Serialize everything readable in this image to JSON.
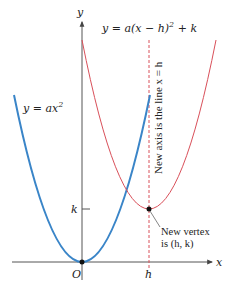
{
  "diagram": {
    "type": "parabola-translation",
    "axes": {
      "x_label": "x",
      "y_label": "y",
      "origin_label": "O",
      "h_tick_label": "h",
      "k_tick_label": "k"
    },
    "curves": [
      {
        "name": "original-parabola",
        "equation_lhs": "y = ax",
        "equation_exp": "2",
        "color": "#3a85c8",
        "vertex": "(0, 0)"
      },
      {
        "name": "translated-parabola",
        "equation": "y = a(x − h)",
        "equation_exp": "2",
        "equation_tail": " + k",
        "color": "#d9505a",
        "vertex": "(h, k)"
      }
    ],
    "axis_of_symmetry_label": "New axis is the line x = h",
    "axis_color": "#d9505a",
    "vertex_annotation": {
      "line1": "New vertex",
      "line2": "is (h, k)"
    }
  }
}
